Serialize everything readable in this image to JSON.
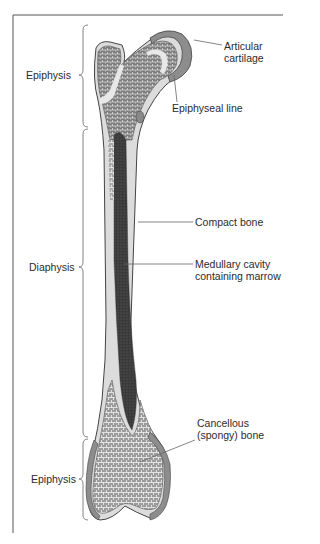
{
  "figure": {
    "left_labels": {
      "epiphysis_top": "Epiphysis",
      "diaphysis": "Diaphysis",
      "epiphysis_bottom": "Epiphysis"
    },
    "right_labels": {
      "articular_cartilage_1": "Articular",
      "articular_cartilage_2": "cartilage",
      "epiphyseal_line": "Epiphyseal line",
      "compact_bone": "Compact bone",
      "medullary_1": "Medullary cavity",
      "medullary_2": "containing marrow",
      "cancellous_1": "Cancellous",
      "cancellous_2": "(spongy) bone"
    },
    "colors": {
      "frame": "#555555",
      "spongy": "#8a8a8a",
      "spongy_dark": "#5a5a5a",
      "compact": "#d9d9d9",
      "marrow": "#3c3c3c",
      "cartilage": "#9a9a9a",
      "leader": "#666666"
    }
  }
}
